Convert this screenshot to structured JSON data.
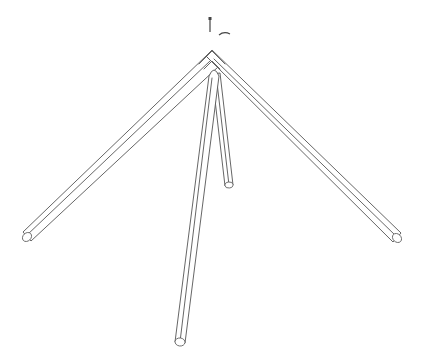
{
  "diagram": {
    "title": "",
    "background": "#ffffff",
    "line_color": "#555555",
    "parts": [
      {
        "id": "left-pole",
        "type": "tube",
        "from": [
          212,
          61
        ],
        "to": [
          27,
          236
        ],
        "width": 9
      },
      {
        "id": "right-pole",
        "type": "tube",
        "from": [
          212,
          61
        ],
        "to": [
          397,
          238
        ],
        "width": 9
      },
      {
        "id": "center-pole-long",
        "type": "tube",
        "from": [
          214,
          72
        ],
        "to": [
          180,
          343
        ],
        "width": 9
      },
      {
        "id": "center-pole-short",
        "type": "tube",
        "from": [
          216,
          72
        ],
        "to": [
          229,
          185
        ],
        "width": 7
      }
    ],
    "annotations": [
      {
        "id": "screw-mark",
        "type": "screw",
        "x": 210,
        "y": 21
      },
      {
        "id": "dash-mark",
        "type": "dash",
        "x": 225,
        "y": 34
      }
    ]
  }
}
